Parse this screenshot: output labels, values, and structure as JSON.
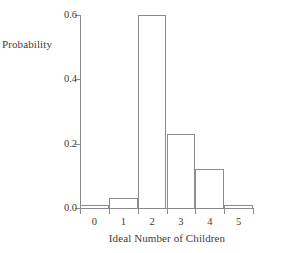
{
  "chart_data": {
    "type": "bar",
    "title": "",
    "subtitle": "",
    "xlabel": "Ideal Number of Children",
    "ylabel": "Probability",
    "categories": [
      "0",
      "1",
      "2",
      "3",
      "4",
      "5"
    ],
    "values": [
      0.01,
      0.03,
      0.6,
      0.23,
      0.12,
      0.01
    ],
    "ylim": [
      0.0,
      0.6
    ],
    "yticks": [
      0.0,
      0.2,
      0.4,
      0.6
    ],
    "ytick_labels": [
      "0.0",
      "0.2",
      "0.4",
      "0.6"
    ],
    "xtick_labels": [
      "0",
      "1",
      "2",
      "3",
      "4",
      "5"
    ],
    "grid": false,
    "legend": false,
    "legend_position": "none",
    "bar_style": {
      "fill": "#ffffff",
      "edge": "#8c8c8c",
      "edge_width_px": 1,
      "adjacent": true
    },
    "axis_color": "#8c8c8c",
    "text_color": "#3c3c3c",
    "background": "#ffffff",
    "annotations": []
  }
}
